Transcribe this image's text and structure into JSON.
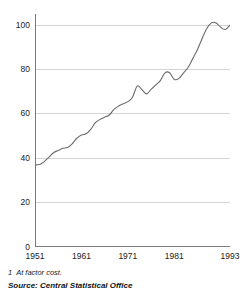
{
  "chart_data": {
    "type": "line",
    "title": "",
    "xlabel": "",
    "ylabel": "",
    "xlim": [
      1951,
      1993
    ],
    "ylim": [
      0,
      105
    ],
    "grid": true,
    "grid_axis": "y",
    "legend": "none",
    "line_color": "#6b6b6b",
    "grid_color": "#d4d4d4",
    "axis_color": "#7a7a7a",
    "yticks": [
      0,
      20,
      40,
      60,
      80,
      100
    ],
    "ytick_labels": [
      "0",
      "20",
      "40",
      "60",
      "80",
      "100"
    ],
    "xticks": [
      1951,
      1961,
      1971,
      1981,
      1993
    ],
    "xtick_labels": [
      "1951",
      "1961",
      "1971",
      "1981",
      "1993"
    ],
    "series": [
      {
        "name": "Index",
        "x": [
          1951,
          1952,
          1953,
          1954,
          1955,
          1956,
          1957,
          1958,
          1959,
          1960,
          1961,
          1962,
          1963,
          1964,
          1965,
          1966,
          1967,
          1968,
          1969,
          1970,
          1971,
          1972,
          1973,
          1974,
          1975,
          1976,
          1977,
          1978,
          1979,
          1980,
          1981,
          1982,
          1983,
          1984,
          1985,
          1986,
          1987,
          1988,
          1989,
          1990,
          1991,
          1992,
          1993
        ],
        "values": [
          37.0,
          37.2,
          38.5,
          40.5,
          42.5,
          43.5,
          44.5,
          44.8,
          46.5,
          49.0,
          50.5,
          51.0,
          53.0,
          56.0,
          57.5,
          58.5,
          59.5,
          62.0,
          63.5,
          64.5,
          65.5,
          67.5,
          72.5,
          71.0,
          69.0,
          71.0,
          73.0,
          75.0,
          78.5,
          78.5,
          75.5,
          76.0,
          78.5,
          81.0,
          85.0,
          89.0,
          94.0,
          98.5,
          101.0,
          101.0,
          99.0,
          98.0,
          100.0
        ]
      }
    ]
  },
  "footnote": {
    "marker": "1",
    "text": "At factor cost."
  },
  "source": {
    "text": "Source: Central Statistical Office"
  },
  "axis": {
    "y_label_0": "0",
    "y_label_20": "20",
    "y_label_40": "40",
    "y_label_60": "60",
    "y_label_80": "80",
    "y_label_100": "100",
    "x_label_1951": "1951",
    "x_label_1961": "1961",
    "x_label_1971": "1971",
    "x_label_1981": "1981",
    "x_label_1993": "1993"
  }
}
